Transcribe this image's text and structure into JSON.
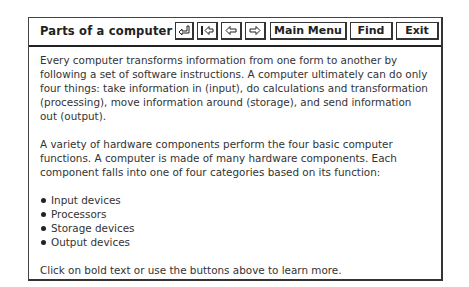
{
  "window": {
    "title": "Parts of a computer"
  },
  "toolbar": {
    "buttons": [
      {
        "id": "return",
        "icon": "return-arrow-icon",
        "label": ""
      },
      {
        "id": "first",
        "icon": "first-page-icon",
        "label": ""
      },
      {
        "id": "back",
        "icon": "left-arrow-icon",
        "label": ""
      },
      {
        "id": "forward",
        "icon": "right-arrow-icon",
        "label": ""
      },
      {
        "id": "main_menu",
        "label": "Main Menu"
      },
      {
        "id": "find",
        "label": "Find"
      },
      {
        "id": "exit",
        "label": "Exit"
      }
    ]
  },
  "content": {
    "paragraphs": [
      "Every computer transforms information from one form to another by following a set of software instructions. A computer ultimately can do only four things: take information in (input), do calculations and transformation (processing), move information around (storage), and send information out (output).",
      "A variety of hardware components perform the four basic computer functions. A computer is made of many hardware components. Each component falls into one of four categories based on its function:"
    ],
    "list": [
      "Input devices",
      "Processors",
      "Storage devices",
      "Output devices"
    ],
    "footer": "Click on bold text or use the buttons above to learn more."
  }
}
